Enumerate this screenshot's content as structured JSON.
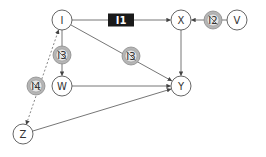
{
  "diagram": {
    "nodes": [
      {
        "id": "I",
        "label": "I",
        "kind": "variable"
      },
      {
        "id": "X",
        "label": "X",
        "kind": "variable"
      },
      {
        "id": "V",
        "label": "V",
        "kind": "variable"
      },
      {
        "id": "W",
        "label": "W",
        "kind": "variable"
      },
      {
        "id": "Y",
        "label": "Y",
        "kind": "variable"
      },
      {
        "id": "Z",
        "label": "Z",
        "kind": "variable"
      }
    ],
    "interventions": [
      {
        "id": "I1",
        "label": "I1",
        "kind": "box",
        "on_edge": "I->X"
      },
      {
        "id": "I2",
        "label": "I2",
        "kind": "crossed",
        "on_edge": "V->X"
      },
      {
        "id": "I3a",
        "label": "I3",
        "kind": "crossed",
        "on_edge": "I->W"
      },
      {
        "id": "I3b",
        "label": "I3",
        "kind": "crossed",
        "on_edge": "I->Y"
      },
      {
        "id": "I4",
        "label": "I4",
        "kind": "crossed",
        "on_edge": "Z<->I"
      }
    ],
    "edges": [
      {
        "from": "I",
        "to": "X",
        "style": "solid",
        "arrow": "end"
      },
      {
        "from": "V",
        "to": "X",
        "style": "solid",
        "arrow": "end"
      },
      {
        "from": "X",
        "to": "Y",
        "style": "solid",
        "arrow": "end"
      },
      {
        "from": "I",
        "to": "W",
        "style": "solid",
        "arrow": "end"
      },
      {
        "from": "I",
        "to": "Y",
        "style": "solid",
        "arrow": "end"
      },
      {
        "from": "W",
        "to": "Y",
        "style": "solid",
        "arrow": "end"
      },
      {
        "from": "Z",
        "to": "Y",
        "style": "solid",
        "arrow": "end"
      },
      {
        "from": "Z",
        "to": "I",
        "style": "dashed",
        "arrow": "both"
      }
    ]
  }
}
